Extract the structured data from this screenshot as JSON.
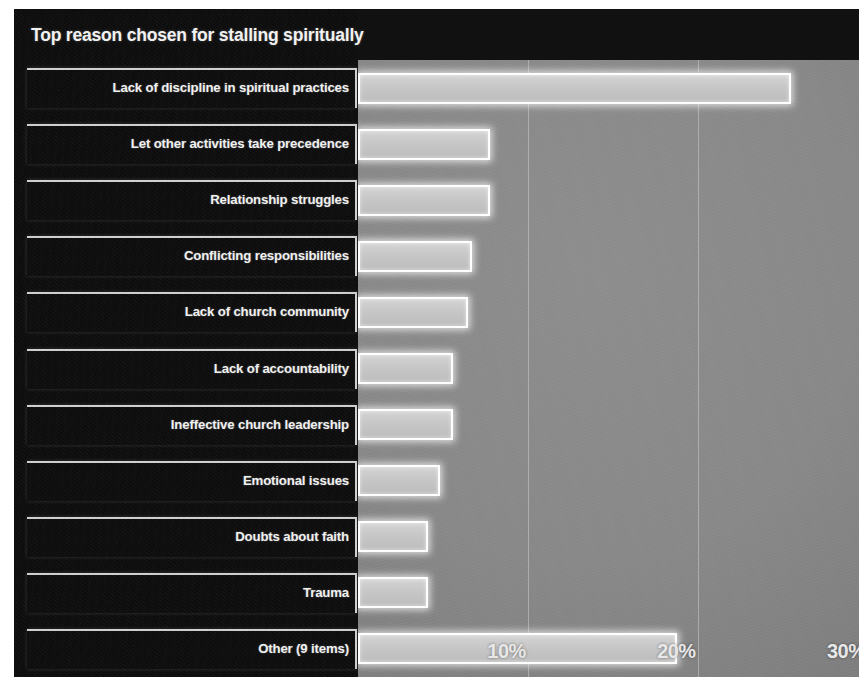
{
  "chart": {
    "title": "Top reason chosen for stalling spiritually"
  },
  "axis": {
    "ticks": [
      "10%",
      "20%",
      "30%"
    ],
    "tick_values": [
      10,
      20,
      30
    ],
    "xmin": 0,
    "xmax": 29.5
  },
  "colors": {
    "panel_background": "#0d0d0d",
    "plot_background": "#8a8a8a",
    "bar_fill": "#c8c8c8",
    "bar_border": "#ffffff",
    "label_text": "#f0f0f0",
    "title_text": "#f2f2f2",
    "gridline": "#e1e1e1"
  },
  "chart_data": {
    "type": "bar",
    "orientation": "horizontal",
    "title": "Top reason chosen for stalling spiritually",
    "xlabel": "",
    "ylabel": "",
    "xlim": [
      0,
      29.5
    ],
    "grid": true,
    "legend": false,
    "tick_labels": [
      "10%",
      "20%",
      "30%"
    ],
    "categories": [
      "Lack of discipline in spiritual practices",
      "Let other activities take precedence",
      "Relationship struggles",
      "Conflicting responsibilities",
      "Lack of church community",
      "Lack of accountability",
      "Ineffective church leadership",
      "Emotional issues",
      "Doubts about faith",
      "Trauma",
      "Other (9 items)"
    ],
    "values": [
      25.5,
      7.8,
      7.8,
      6.7,
      6.5,
      5.6,
      5.6,
      4.8,
      4.1,
      4.1,
      18.8
    ]
  }
}
